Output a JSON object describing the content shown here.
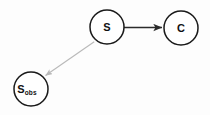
{
  "figure": {
    "background_color": "#fdfdfd",
    "width": 210,
    "height": 115
  },
  "nodes": [
    {
      "id": "s",
      "name": "node-s",
      "label": "S",
      "subscript": "",
      "cx": 107,
      "cy": 27,
      "r": 17,
      "stroke_color": "#1a1a1a",
      "fill_color": "#ffffff"
    },
    {
      "id": "c",
      "name": "node-c",
      "label": "C",
      "subscript": "",
      "cx": 181,
      "cy": 28,
      "r": 17,
      "stroke_color": "#1a1a1a",
      "fill_color": "#ffffff"
    },
    {
      "id": "s_obs",
      "name": "node-s-obs",
      "label": "S",
      "subscript": "obs",
      "cx": 31,
      "cy": 89,
      "r": 17,
      "stroke_color": "#1a1a1a",
      "fill_color": "#ffffff"
    }
  ],
  "edges": [
    {
      "id": "s-to-c",
      "name": "edge-s-to-c",
      "from": "s",
      "to": "c",
      "x1": 124,
      "y1": 27.5,
      "x2": 162,
      "y2": 27.5,
      "color": "#2b2b2b",
      "style": "solid",
      "arrowhead": "filled",
      "marker": "arrow-strong"
    },
    {
      "id": "s-to-s-obs",
      "name": "edge-s-to-s-obs",
      "from": "s",
      "to": "s_obs",
      "x1": 94.2,
      "y1": 41.8,
      "x2": 45.5,
      "y2": 75.5,
      "color": "#b9b9b9",
      "style": "solid",
      "arrowhead": "filled",
      "marker": "arrow-faint"
    }
  ],
  "artifacts": {
    "description": "faint scanner bleed-through text",
    "lines": [
      {
        "text": "",
        "x": 12,
        "y": 30
      },
      {
        "text": "",
        "x": 70,
        "y": 64
      },
      {
        "text": "",
        "x": 70,
        "y": 78
      },
      {
        "text": "",
        "x": 84,
        "y": 92
      },
      {
        "text": "",
        "x": 86,
        "y": 106
      }
    ]
  }
}
